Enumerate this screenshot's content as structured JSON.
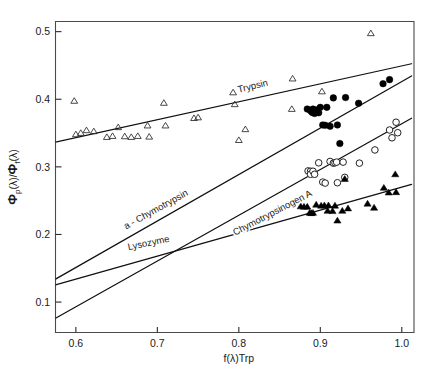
{
  "figure": {
    "background": "#ffffff",
    "width": 433,
    "height": 371
  },
  "chart_data": {
    "type": "scatter",
    "title": "",
    "subtitle": "",
    "xlabel": "f(λ)Trp",
    "ylabel": "Φp(λ)/Φf(λ)",
    "ylabel_parts": {
      "phi": "Φ",
      "sub_p": "p",
      "lambda": "(λ)",
      "slash": "/",
      "sub_f": "f"
    },
    "xlim": [
      0.575,
      1.015
    ],
    "ylim": [
      0.055,
      0.515
    ],
    "xticks": [
      0.6,
      0.7,
      0.8,
      0.9,
      1.0
    ],
    "xtick_labels": [
      "0.6",
      "0.7",
      "0.8",
      "0.9",
      "1.0"
    ],
    "yticks": [
      0.1,
      0.2,
      0.3,
      0.4,
      0.5
    ],
    "ytick_labels": [
      "0.1",
      "0.2",
      "0.3",
      "0.4",
      "0.5"
    ],
    "grid": false,
    "legend_position": "inline-annotations",
    "frame": "full-box",
    "annotations": [
      {
        "text": "Trypsin",
        "x": 0.818,
        "y": 0.415,
        "rotation": -13.5
      },
      {
        "text": "a - Chymotrypsin",
        "x": 0.7,
        "y": 0.233,
        "rotation": -29.0
      },
      {
        "text": "Chymotrypsinogen A",
        "x": 0.843,
        "y": 0.228,
        "rotation": -27.5
      },
      {
        "text": "Lysozyme",
        "x": 0.69,
        "y": 0.183,
        "rotation": -12.0
      }
    ],
    "series": [
      {
        "name": "Trypsin",
        "marker": "open-triangle",
        "color": "#333333",
        "fit_line": {
          "x0": 0.575,
          "y0": 0.3365,
          "x1": 1.012,
          "y1": 0.4525
        },
        "points": [
          [
            0.598,
            0.3975
          ],
          [
            0.6,
            0.348
          ],
          [
            0.606,
            0.35
          ],
          [
            0.613,
            0.354
          ],
          [
            0.622,
            0.3525
          ],
          [
            0.638,
            0.344
          ],
          [
            0.645,
            0.3455
          ],
          [
            0.652,
            0.3585
          ],
          [
            0.66,
            0.345
          ],
          [
            0.668,
            0.344
          ],
          [
            0.676,
            0.3455
          ],
          [
            0.688,
            0.361
          ],
          [
            0.69,
            0.3445
          ],
          [
            0.708,
            0.3945
          ],
          [
            0.71,
            0.361
          ],
          [
            0.745,
            0.372
          ],
          [
            0.75,
            0.373
          ],
          [
            0.793,
            0.41
          ],
          [
            0.795,
            0.3925
          ],
          [
            0.8,
            0.3395
          ],
          [
            0.808,
            0.3555
          ],
          [
            0.865,
            0.3855
          ],
          [
            0.866,
            0.4305
          ],
          [
            0.902,
            0.4115
          ],
          [
            0.962,
            0.4975
          ]
        ]
      },
      {
        "name": "a - Chymotrypsin",
        "marker": "filled-circle",
        "color": "#000000",
        "fit_line": {
          "x0": 0.575,
          "y0": 0.134,
          "x1": 1.012,
          "y1": 0.4345
        },
        "points": [
          [
            0.884,
            0.3855
          ],
          [
            0.888,
            0.383
          ],
          [
            0.89,
            0.3805
          ],
          [
            0.891,
            0.3855
          ],
          [
            0.893,
            0.379
          ],
          [
            0.896,
            0.3845
          ],
          [
            0.898,
            0.38
          ],
          [
            0.9,
            0.388
          ],
          [
            0.903,
            0.362
          ],
          [
            0.906,
            0.3615
          ],
          [
            0.908,
            0.388
          ],
          [
            0.912,
            0.36
          ],
          [
            0.916,
            0.402
          ],
          [
            0.921,
            0.362
          ],
          [
            0.924,
            0.3345
          ],
          [
            0.931,
            0.4025
          ],
          [
            0.947,
            0.394
          ],
          [
            0.977,
            0.423
          ],
          [
            0.985,
            0.429
          ]
        ]
      },
      {
        "name": "Chymotrypsinogen A",
        "marker": "open-circle",
        "color": "#222222",
        "fit_line": {
          "x0": 0.575,
          "y0": 0.076,
          "x1": 1.012,
          "y1": 0.372
        },
        "points": [
          [
            0.885,
            0.294
          ],
          [
            0.888,
            0.2935
          ],
          [
            0.888,
            0.289
          ],
          [
            0.891,
            0.2935
          ],
          [
            0.893,
            0.289
          ],
          [
            0.898,
            0.306
          ],
          [
            0.903,
            0.2775
          ],
          [
            0.906,
            0.276
          ],
          [
            0.912,
            0.308
          ],
          [
            0.916,
            0.3055
          ],
          [
            0.918,
            0.306
          ],
          [
            0.92,
            0.307
          ],
          [
            0.921,
            0.2765
          ],
          [
            0.928,
            0.307
          ],
          [
            0.93,
            0.2845
          ],
          [
            0.948,
            0.3055
          ],
          [
            0.967,
            0.325
          ],
          [
            0.985,
            0.3545
          ],
          [
            0.988,
            0.343
          ],
          [
            0.993,
            0.366
          ],
          [
            0.995,
            0.3505
          ]
        ]
      },
      {
        "name": "Trypsinogen-triangles",
        "marker": "filled-triangle",
        "color": "#000000",
        "fit_line": {
          "x0": 0.575,
          "y0": 0.1255,
          "x1": 1.012,
          "y1": 0.274
        },
        "points": [
          [
            0.876,
            0.2415
          ],
          [
            0.88,
            0.241
          ],
          [
            0.884,
            0.241
          ],
          [
            0.887,
            0.232
          ],
          [
            0.889,
            0.2315
          ],
          [
            0.891,
            0.232
          ],
          [
            0.895,
            0.244
          ],
          [
            0.901,
            0.2425
          ],
          [
            0.905,
            0.243
          ],
          [
            0.909,
            0.235
          ],
          [
            0.91,
            0.243
          ],
          [
            0.915,
            0.2345
          ],
          [
            0.918,
            0.2425
          ],
          [
            0.921,
            0.2205
          ],
          [
            0.927,
            0.235
          ],
          [
            0.934,
            0.2385
          ],
          [
            0.93,
            0.282
          ],
          [
            0.958,
            0.2455
          ],
          [
            0.966,
            0.2395
          ],
          [
            0.978,
            0.269
          ],
          [
            0.984,
            0.262
          ],
          [
            0.992,
            0.289
          ],
          [
            0.993,
            0.2625
          ]
        ]
      }
    ]
  }
}
